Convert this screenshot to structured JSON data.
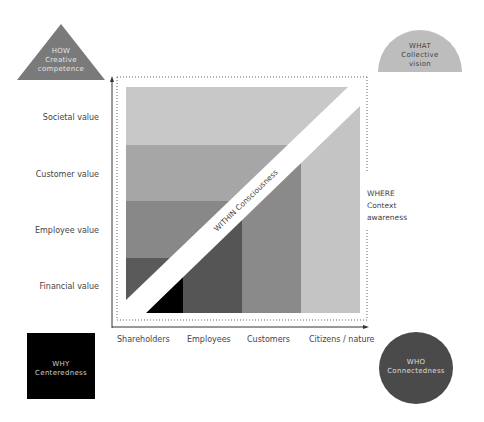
{
  "diagram": {
    "y_axis": {
      "labels": [
        "Societal value",
        "Customer value",
        "Employee value",
        "Financial value"
      ]
    },
    "x_axis": {
      "labels": [
        "Shareholders",
        "Employees",
        "Customers",
        "Citizens / nature"
      ]
    },
    "diagonal_label": "WITHIN  Consciousness",
    "where": {
      "line1": "WHERE",
      "line2": "Context",
      "line3": "awareness"
    },
    "how": {
      "line1": "HOW",
      "line2": "Creative",
      "line3": "competence"
    },
    "what": {
      "line1": "WHAT",
      "line2": "Collective",
      "line3": "vision"
    },
    "why": {
      "line1": "WHY",
      "line2": "Centeredness"
    },
    "who": {
      "line1": "WHO",
      "line2": "Connectedness"
    },
    "colors": {
      "square_largest": "#c8c8c8",
      "square_large": "#a6a6a6",
      "square_medium": "#888888",
      "square_small": "#5a5a5a",
      "core": "#000000",
      "how_triangle": "#7a7a7a",
      "what_semicircle": "#bdbdbd",
      "why_square": "#000000",
      "who_circle": "#4a4a4a"
    }
  }
}
